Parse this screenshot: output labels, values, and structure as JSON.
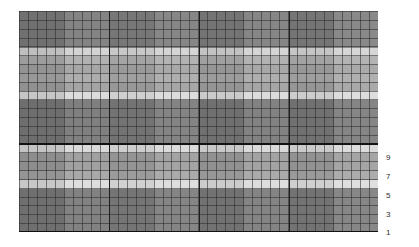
{
  "figure": {
    "title": "",
    "background_color": "#ffffff"
  },
  "axis": {
    "position": "right",
    "label": "",
    "tick_labels": [
      "9",
      "7",
      "5",
      "3",
      "1"
    ],
    "tick_y": [
      157,
      176,
      195,
      214,
      232
    ],
    "tick_label_x": 386
  },
  "plot": {
    "left": 19,
    "top": 11,
    "width": 359,
    "height": 221,
    "grid": "on",
    "minor_grid_color": "#282828",
    "major_grid_color": "#1e1e1e",
    "cell_width_px": 8.97,
    "cell_height_px": 8.84
  },
  "rules": [
    {
      "name": "mid-separator",
      "y": 132,
      "thickness": 2.2,
      "color": "#111111"
    },
    {
      "name": "bottom-axis",
      "y": 220,
      "thickness": 2.2,
      "color": "#111111"
    }
  ],
  "major_vlines_x": [
    90,
    180,
    270
  ],
  "chart_data": {
    "type": "heatmap",
    "title": "",
    "xlabel": "",
    "ylabel": "",
    "grid": true,
    "legend": "none",
    "colormap": "gray",
    "axis_side": "right",
    "yticks": [
      9,
      7,
      5,
      3,
      1
    ],
    "ytick_positions_px": [
      157,
      176,
      195,
      214,
      232
    ],
    "ylim": [
      1,
      9
    ],
    "row_bands": [
      {
        "y0": 0,
        "y1": 37,
        "value": 0.42,
        "color": "#7d7d7d"
      },
      {
        "y0": 37,
        "y1": 45,
        "value": 0.83,
        "color": "#d2d2d2"
      },
      {
        "y0": 45,
        "y1": 53,
        "value": 0.68,
        "color": "#adadad"
      },
      {
        "y0": 53,
        "y1": 62,
        "value": 0.63,
        "color": "#a2a2a2"
      },
      {
        "y0": 62,
        "y1": 71,
        "value": 0.66,
        "color": "#a8a8a8"
      },
      {
        "y0": 71,
        "y1": 80,
        "value": 0.62,
        "color": "#a0a0a0"
      },
      {
        "y0": 80,
        "y1": 89,
        "value": 0.87,
        "color": "#dadada"
      },
      {
        "y0": 89,
        "y1": 132,
        "value": 0.4,
        "color": "#797979"
      },
      {
        "y0": 132,
        "y1": 142,
        "value": 0.86,
        "color": "#d8d8d8"
      },
      {
        "y0": 142,
        "y1": 160,
        "value": 0.6,
        "color": "#9c9c9c"
      },
      {
        "y0": 160,
        "y1": 169,
        "value": 0.64,
        "color": "#a4a4a4"
      },
      {
        "y0": 169,
        "y1": 178,
        "value": 0.88,
        "color": "#dcdcdc"
      },
      {
        "y0": 178,
        "y1": 221,
        "value": 0.41,
        "color": "#7b7b7b"
      }
    ],
    "column_modulation": [
      {
        "x0": 0,
        "x1": 45,
        "delta": -0.015
      },
      {
        "x0": 45,
        "x1": 90,
        "delta": 0.01
      },
      {
        "x0": 90,
        "x1": 135,
        "delta": -0.008
      },
      {
        "x0": 135,
        "x1": 180,
        "delta": 0.014
      },
      {
        "x0": 180,
        "x1": 225,
        "delta": -0.012
      },
      {
        "x0": 225,
        "x1": 270,
        "delta": 0.012
      },
      {
        "x0": 270,
        "x1": 315,
        "delta": -0.01
      },
      {
        "x0": 315,
        "x1": 359,
        "delta": 0.016
      }
    ]
  }
}
